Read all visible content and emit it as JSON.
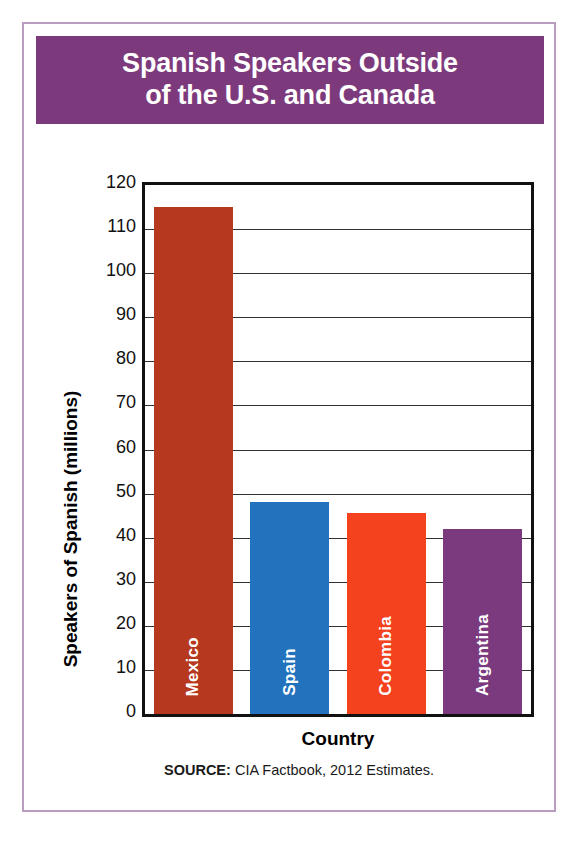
{
  "title": {
    "line1": "Spanish Speakers Outside",
    "line2": "of the U.S. and Canada",
    "banner_color": "#7c3a7c",
    "text_color": "#ffffff"
  },
  "source": {
    "label": "SOURCE:",
    "text": " CIA Factbook, 2012 Estimates."
  },
  "frame": {
    "border_color": "#b99cc0"
  },
  "chart_data": {
    "type": "bar",
    "title": "Spanish Speakers Outside of the U.S. and Canada",
    "xlabel": "Country",
    "ylabel": "Speakers of Spanish (millions)",
    "categories": [
      "Mexico",
      "Spain",
      "Colombia",
      "Argentina"
    ],
    "values": [
      115,
      48,
      45.5,
      42
    ],
    "colors": [
      "#b5381f",
      "#2272bd",
      "#f4411e",
      "#7b3a7e"
    ],
    "ylim": [
      0,
      120
    ],
    "ytick_step": 10,
    "yticks": [
      0,
      10,
      20,
      30,
      40,
      50,
      60,
      70,
      80,
      90,
      100,
      110,
      120
    ],
    "ytick_labels": [
      "0",
      "10",
      "20",
      "30",
      "40",
      "50",
      "60",
      "70",
      "80",
      "90",
      "100",
      "110",
      "120"
    ],
    "grid": true,
    "grid_axis": "y",
    "legend": false,
    "bar_label_position": "inside-bottom-vertical",
    "units": "millions"
  }
}
